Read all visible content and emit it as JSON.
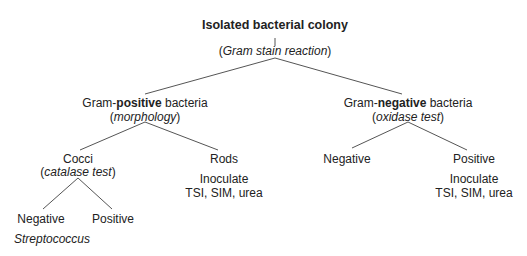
{
  "diagram": {
    "root": {
      "label": "Isolated bacterial colony",
      "test": "Gram stain reaction"
    },
    "gram_positive": {
      "prefix": "Gram-",
      "emphasis": "positive",
      "suffix": " bacteria",
      "test": "morphology"
    },
    "gram_negative": {
      "prefix": "Gram-",
      "emphasis": "negative",
      "suffix": " bacteria",
      "test": "oxidase test"
    },
    "cocci": {
      "label": "Cocci",
      "test": "catalase test"
    },
    "rods": {
      "label": "Rods",
      "note_line1": "Inoculate",
      "note_line2": "TSI, SIM, urea"
    },
    "cocci_negative": {
      "label": "Negative",
      "result": "Streptococcus"
    },
    "cocci_positive": {
      "label": "Positive"
    },
    "oxidase_negative": {
      "label": "Negative"
    },
    "oxidase_positive": {
      "label": "Positive",
      "note_line1": "Inoculate",
      "note_line2": "TSI, SIM, urea"
    },
    "paren_open": "(",
    "paren_close": ")"
  }
}
